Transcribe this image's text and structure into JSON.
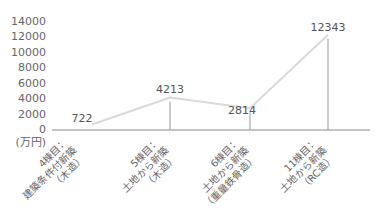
{
  "chart_data": {
    "type": "line",
    "title": "",
    "xlabel": "",
    "ylabel": "(万円)",
    "ylim": [
      0,
      14000
    ],
    "yticks": [
      0,
      2000,
      4000,
      6000,
      8000,
      10000,
      12000,
      14000
    ],
    "grid": false,
    "legend": null,
    "categories": [
      [
        "4棟目：",
        "建築条件付新築",
        "（木造）"
      ],
      [
        "5棟目：",
        "土地から新築",
        "（木造）"
      ],
      [
        "6棟目：",
        "土地から新築",
        "（重量鉄骨造）"
      ],
      [
        "11棟目：",
        "土地から新築",
        "（RC造）"
      ]
    ],
    "values": [
      722,
      4213,
      2814,
      12343
    ],
    "data_labels": [
      "722",
      "4213",
      "2814",
      "12343"
    ],
    "line_color": "#d9d9d9",
    "axis_color": "#888888"
  }
}
